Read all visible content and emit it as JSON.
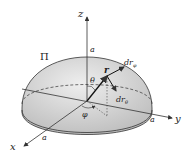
{
  "diagram": {
    "labels": {
      "z_axis": "z",
      "y_axis": "y",
      "x_axis": "x",
      "a_top": "a",
      "a_right": "a",
      "a_front": "a",
      "pi": "Π",
      "r": "r",
      "theta": "θ",
      "phi": "φ",
      "dr_phi": "dr",
      "dr_phi_sub": "φ",
      "dr_theta": "dr",
      "dr_theta_sub": "θ"
    },
    "colors": {
      "surface": "#d6d6d6",
      "line": "#333333",
      "background": "#ffffff"
    }
  }
}
